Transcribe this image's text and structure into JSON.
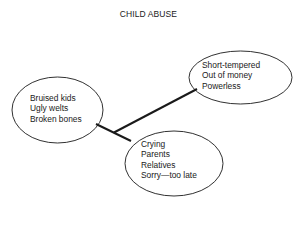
{
  "title": "CHILD ABUSE",
  "nodes": [
    {
      "id": "left",
      "lines": [
        "Bruised kids",
        "Ugly welts",
        "Broken bones"
      ]
    },
    {
      "id": "right",
      "lines": [
        "Short-tempered",
        "Out of money",
        "Powerless"
      ]
    },
    {
      "id": "bottom",
      "lines": [
        "Crying",
        "Parents",
        "Relatives",
        "Sorry—too late"
      ]
    }
  ],
  "colors": {
    "stroke": "#1a1a1a",
    "background": "#ffffff"
  }
}
